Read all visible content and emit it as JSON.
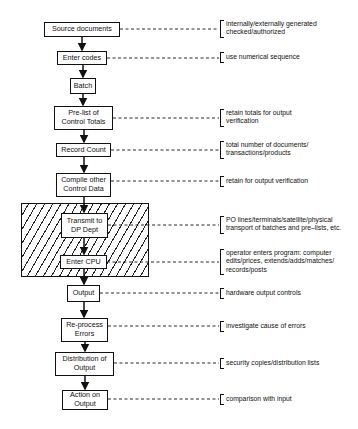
{
  "diagram": {
    "steps": [
      {
        "id": "source-documents",
        "label": "Source documents",
        "note": "internally/externally generated checked/authorized"
      },
      {
        "id": "enter-codes",
        "label": "Enter codes",
        "note": "use numerical sequence"
      },
      {
        "id": "batch",
        "label": "Batch",
        "note": ""
      },
      {
        "id": "pre-list",
        "label": "Pre-list of Control Totals",
        "note": "retain totals for output verification"
      },
      {
        "id": "record-count",
        "label": "Record Count",
        "note": "total number of documents/ transactions/products"
      },
      {
        "id": "compile-other",
        "label": "Compile other Control Data",
        "note": "retain for output verification"
      },
      {
        "id": "transmit",
        "label": "Transmit to DP Dept",
        "note": "PO lines/terminals/satellite/physical transport of batches and pre–lists, etc."
      },
      {
        "id": "enter-cpu",
        "label": "Enter CPU",
        "note": "operator enters program: computer edits/prices, extends/adds/matches/ records/posts"
      },
      {
        "id": "output",
        "label": "Output",
        "note": "hardware output controls"
      },
      {
        "id": "reprocess",
        "label": "Re-process Errors",
        "note": "investigate cause of errors"
      },
      {
        "id": "distribution",
        "label": "Distribution of Output",
        "note": "security copies/distribution lists"
      },
      {
        "id": "action",
        "label": "Action on Output",
        "note": "comparison with input"
      }
    ],
    "hatched_region": {
      "contains": [
        "Transmit to DP Dept",
        "Enter CPU"
      ]
    }
  }
}
